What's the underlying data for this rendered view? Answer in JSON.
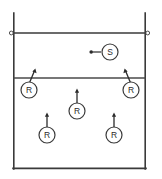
{
  "diagram": {
    "court": {
      "left": 13,
      "right": 146,
      "top": 13,
      "bottom": 169,
      "net_y": 33,
      "attack_line_y": 78,
      "line_color": "#3a3a3a",
      "background_color": "#ffffff"
    },
    "net": {
      "name": "net",
      "left_post_x": 13,
      "right_post_x": 146,
      "post_top_y": 13,
      "post_bottom_y": 169,
      "cap_radius": 2
    },
    "players": [
      {
        "id": "server",
        "label": "S",
        "role": "server",
        "cx": 110,
        "cy": 52,
        "r": 8,
        "arrow": {
          "type": "serve-path",
          "direction": "left",
          "from_x": 102,
          "to_x": 91,
          "y": 52,
          "ball_dot": true
        }
      },
      {
        "id": "receiver-left-front",
        "label": "R",
        "role": "receiver",
        "cx": 29,
        "cy": 90,
        "r": 8,
        "arrow": {
          "type": "movement",
          "direction": "up-right",
          "dx": 6,
          "dy": -14
        }
      },
      {
        "id": "receiver-right-front",
        "label": "R",
        "role": "receiver",
        "cx": 131,
        "cy": 90,
        "r": 8,
        "arrow": {
          "type": "movement",
          "direction": "up-left",
          "dx": -6,
          "dy": -14
        }
      },
      {
        "id": "receiver-center",
        "label": "R",
        "role": "receiver",
        "cx": 77,
        "cy": 111,
        "r": 8,
        "arrow": {
          "type": "movement",
          "direction": "up",
          "dx": 0,
          "dy": -15
        }
      },
      {
        "id": "receiver-left-back",
        "label": "R",
        "role": "receiver",
        "cx": 47,
        "cy": 135,
        "r": 8,
        "arrow": {
          "type": "movement",
          "direction": "up",
          "dx": 0,
          "dy": -15
        }
      },
      {
        "id": "receiver-right-back",
        "label": "R",
        "role": "receiver",
        "cx": 114,
        "cy": 135,
        "r": 8,
        "arrow": {
          "type": "movement",
          "direction": "up",
          "dx": 0,
          "dy": -15
        }
      }
    ]
  }
}
